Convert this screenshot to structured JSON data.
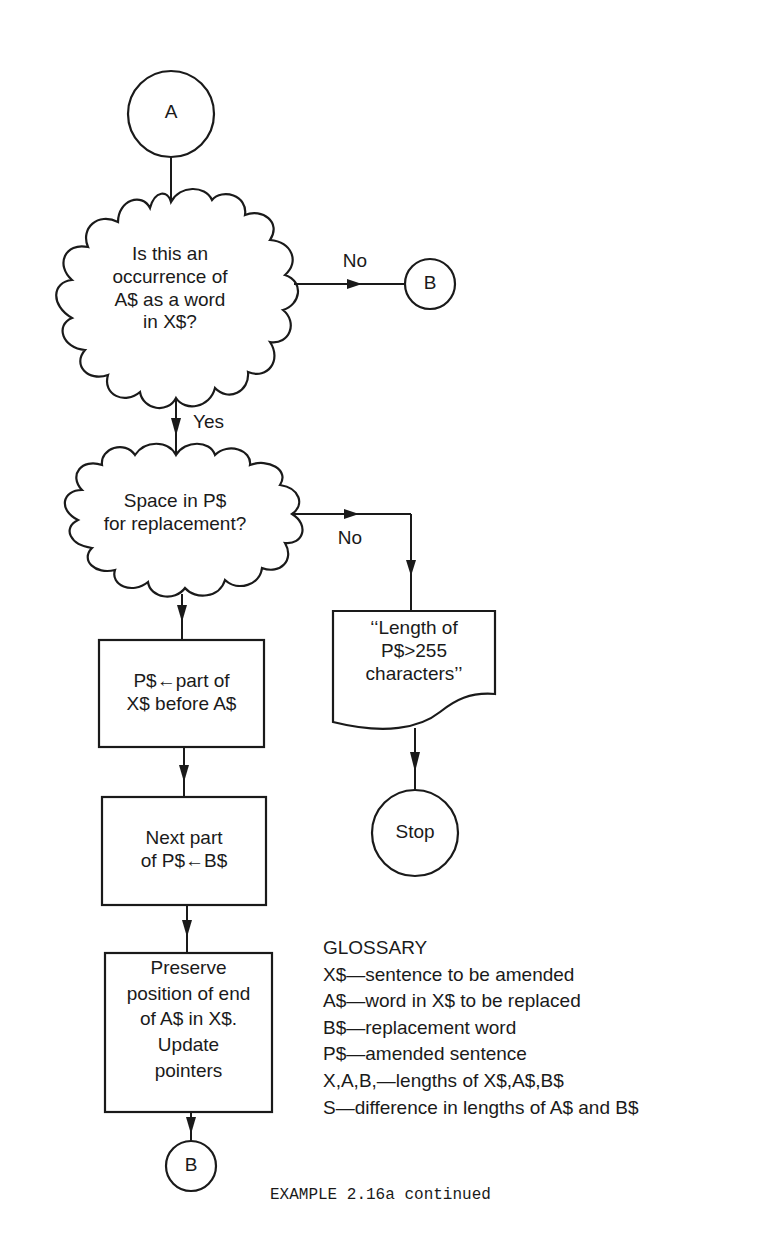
{
  "nodes": {
    "connector_a": {
      "label": "A"
    },
    "decision_occurrence": {
      "lines": [
        "Is this an",
        "occurrence of",
        "A$ as a word",
        "in X$?"
      ]
    },
    "connector_b_top": {
      "label": "B"
    },
    "decision_space": {
      "lines": [
        "Space in P$",
        "for replacement?"
      ]
    },
    "process_before": {
      "lines": [
        "P$←part of",
        "X$ before A$"
      ]
    },
    "output_error": {
      "lines": [
        "‘‘Length of",
        "P$>255",
        "characters’’"
      ]
    },
    "terminal_stop": {
      "label": "Stop"
    },
    "process_next": {
      "lines": [
        "Next part",
        "of P$←B$"
      ]
    },
    "process_preserve": {
      "lines": [
        "Preserve",
        "position of end",
        "of A$ in X$.",
        "Update",
        "pointers"
      ]
    },
    "connector_b_bottom": {
      "label": "B"
    }
  },
  "edges": {
    "no_1": "No",
    "yes_1": "Yes",
    "no_2": "No"
  },
  "glossary": {
    "title": "GLOSSARY",
    "entries": [
      "X$—sentence to be amended",
      "A$—word in X$ to be replaced",
      "B$—replacement word",
      "P$—amended sentence",
      "X,A,B,—lengths of X$,A$,B$",
      "S—difference in lengths of A$ and B$"
    ]
  },
  "caption": "EXAMPLE 2.16a continued"
}
